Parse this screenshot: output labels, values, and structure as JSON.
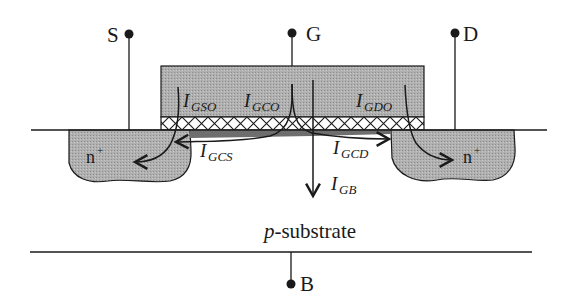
{
  "diagram": {
    "terminals": {
      "source": "S",
      "gate": "G",
      "drain": "D",
      "body": "B"
    },
    "currents": {
      "gso": {
        "main": "I",
        "sub": "GSO"
      },
      "gco": {
        "main": "I",
        "sub": "GCO"
      },
      "gdo": {
        "main": "I",
        "sub": "GDO"
      },
      "gcs": {
        "main": "I",
        "sub": "GCS"
      },
      "gcd": {
        "main": "I",
        "sub": "GCD"
      },
      "gb": {
        "main": "I",
        "sub": "GB"
      }
    },
    "regions": {
      "source_diffusion": {
        "main": "n",
        "sup": "+"
      },
      "drain_diffusion": {
        "main": "n",
        "sup": "+"
      },
      "substrate": {
        "italic": "p",
        "rest": "-substrate"
      }
    },
    "colors": {
      "stroke": "#1a1a1a",
      "gate_fill": "#a9a9a9",
      "diffusion_fill": "#b3b3b3",
      "channel_fill": "#6e6e6e",
      "background": "#ffffff"
    }
  }
}
